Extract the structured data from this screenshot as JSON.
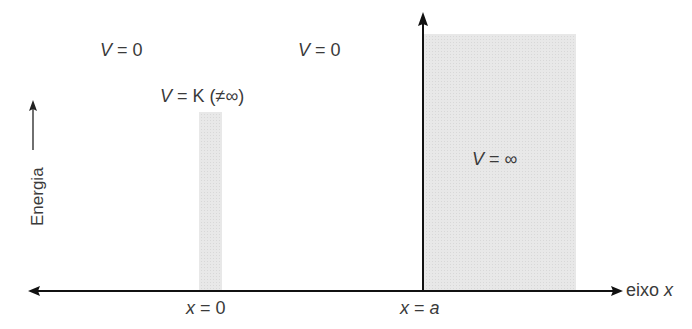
{
  "diagram": {
    "regions": [
      {
        "id": "left",
        "label_var": "V",
        "label_rest": " = 0"
      },
      {
        "id": "middle",
        "label_var": "V",
        "label_rest": " = 0"
      },
      {
        "id": "barrier",
        "label_var": "V",
        "label_rest": " = K (≠∞)"
      },
      {
        "id": "wall",
        "label_var": "V",
        "label_rest": " = ∞"
      }
    ],
    "y_axis_label": "Energia",
    "x_axis_label_text": "eixo ",
    "x_axis_label_var": "x",
    "ticks": [
      {
        "var": "x",
        "rest": " = ",
        "val": "0",
        "val_italic": false
      },
      {
        "var": "x",
        "rest": " = ",
        "val": "a",
        "val_italic": true
      }
    ],
    "colors": {
      "fill": "#e6e6e6",
      "axis": "#111111",
      "text": "#3a3a3a"
    }
  }
}
